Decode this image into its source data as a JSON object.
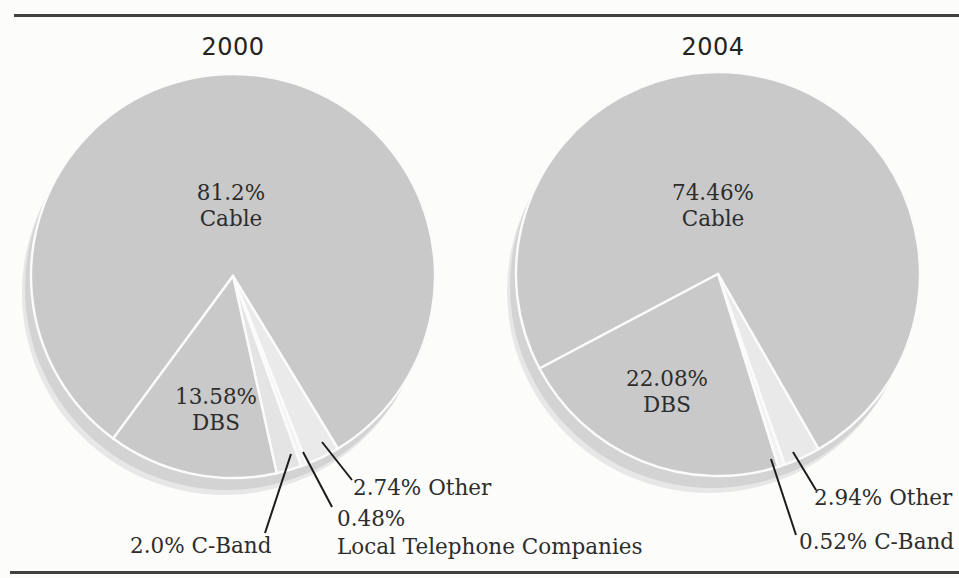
{
  "page": {
    "background": "#fcfcfa",
    "rule_color": "#414141",
    "text_color": "#2d2d2d"
  },
  "chart_data": [
    {
      "type": "pie",
      "title": "2000",
      "center_x": 233,
      "center_y": 276,
      "radius": 202,
      "start_angle_deg": 216.4,
      "draw_order": "clockwise",
      "separator_color": "#fbfbfb",
      "shadow": [
        {
          "dx": -9,
          "dy": 17,
          "color": "#e7e7e7"
        },
        {
          "dx": -6,
          "dy": 12,
          "color": "#d3d3d3"
        }
      ],
      "slices": [
        {
          "label": "Cable",
          "pct": 81.2,
          "display_pct": "81.2%",
          "color": "#c9c9c9"
        },
        {
          "label": "Other",
          "pct": 2.74,
          "display_pct": "2.74%",
          "color": "#eaeaea"
        },
        {
          "label": "Local Telephone Companies",
          "pct": 0.48,
          "display_pct": "0.48%",
          "color": "#f3f3f3"
        },
        {
          "label": "C-Band",
          "pct": 2.0,
          "display_pct": "2.0%",
          "color": "#e4e4e4"
        },
        {
          "label": "DBS",
          "pct": 13.58,
          "display_pct": "13.58%",
          "color": "#c9c9c9"
        }
      ],
      "leader_lines": [
        {
          "x1": 291,
          "y1": 454,
          "x2": 265,
          "y2": 533
        },
        {
          "x1": 303,
          "y1": 452,
          "x2": 332,
          "y2": 507
        },
        {
          "x1": 322,
          "y1": 442,
          "x2": 352,
          "y2": 480
        }
      ],
      "line_color": "#1c1c1c"
    },
    {
      "type": "pie",
      "title": "2004",
      "center_x": 718,
      "center_y": 274,
      "radius": 202,
      "start_angle_deg": 242.1,
      "draw_order": "clockwise",
      "separator_color": "#fbfbfb",
      "shadow": [
        {
          "dx": -9,
          "dy": 17,
          "color": "#e7e7e7"
        },
        {
          "dx": -6,
          "dy": 12,
          "color": "#d3d3d3"
        }
      ],
      "slices": [
        {
          "label": "Cable",
          "pct": 74.46,
          "display_pct": "74.46%",
          "color": "#c9c9c9"
        },
        {
          "label": "Other",
          "pct": 2.94,
          "display_pct": "2.94%",
          "color": "#e9e9e9"
        },
        {
          "label": "C-Band",
          "pct": 0.52,
          "display_pct": "0.52%",
          "color": "#f2f2f2"
        },
        {
          "label": "DBS",
          "pct": 22.08,
          "display_pct": "22.08%",
          "color": "#c9c9c9"
        }
      ],
      "leader_lines": [
        {
          "x1": 793,
          "y1": 452,
          "x2": 816,
          "y2": 490
        },
        {
          "x1": 771,
          "y1": 459,
          "x2": 796,
          "y2": 535
        }
      ],
      "line_color": "#1c1c1c"
    }
  ]
}
